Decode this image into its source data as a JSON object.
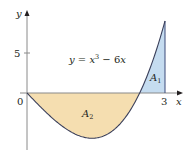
{
  "chart_data": {
    "type": "area",
    "title": "",
    "function_label": "y = x³ − 6x",
    "function_label_parts": {
      "lhs": "y",
      "eq": " = ",
      "x": "x",
      "exp": "3",
      "rest": " − 6",
      "x2": "x"
    },
    "xlabel": "x",
    "ylabel": "y",
    "x_ticks": [
      {
        "value": 0,
        "label": "0"
      },
      {
        "value": 3,
        "label": "3"
      }
    ],
    "y_ticks": [
      {
        "value": 5,
        "label": "5"
      }
    ],
    "xlim": [
      0,
      3
    ],
    "ylim": [
      -6,
      9
    ],
    "grid": false,
    "curve": {
      "expression": "x^3 - 6x",
      "points": [
        [
          0,
          0
        ],
        [
          0.5,
          -2.875
        ],
        [
          1,
          -5
        ],
        [
          1.414,
          -5.657
        ],
        [
          2,
          -4
        ],
        [
          2.449,
          0
        ],
        [
          2.75,
          4.297
        ],
        [
          3,
          9
        ]
      ]
    },
    "regions": [
      {
        "name": "A1",
        "label": "A",
        "subscript": "1",
        "x_range": [
          2.449,
          3
        ],
        "sign": "positive",
        "color": "#c5dcf0"
      },
      {
        "name": "A2",
        "label": "A",
        "subscript": "2",
        "x_range": [
          0,
          2.449
        ],
        "sign": "negative",
        "color": "#f5deb0"
      }
    ],
    "colors": {
      "curve": "#3a3f5a",
      "axis": "#555555",
      "a1_fill": "#c5dcf0",
      "a2_fill": "#f5deb0",
      "boundary": "#3a4a7a"
    }
  }
}
